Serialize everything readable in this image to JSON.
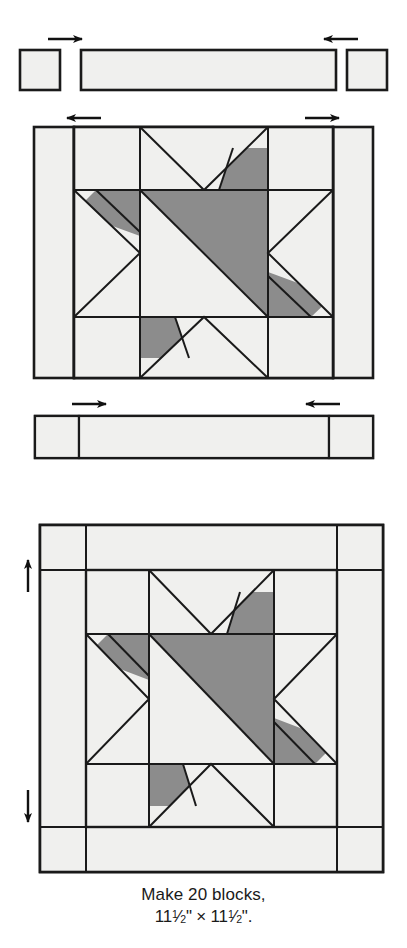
{
  "figure": {
    "caption_line_1": "Make 20 blocks,",
    "caption_line_2_prefix": "11",
    "caption_line_2_frac_num": "1",
    "caption_line_2_frac_den": "2",
    "caption_line_2_mid": "\" × 11",
    "caption_line_2_suffix": "\".",
    "caption_full": "Make 20 blocks, 11½\" × 11½\".",
    "block_count": "20",
    "finished_width": "11½\"",
    "finished_height": "11½\""
  },
  "colors": {
    "background": "#ffffff",
    "outline": "#1a1a1a",
    "light_fabric": "#f0f0ee",
    "medium_light_fabric": "#e8e8e4",
    "dark_fabric": "#8c8c8c",
    "arrow": "#111111",
    "text": "#1a1a1a"
  },
  "steps": [
    {
      "id": "top-sashing-row",
      "name": "Top sashing row pieces",
      "label": "top row: corner square, sashing strip, corner square",
      "arrows": [
        {
          "id": "top-left-arrow",
          "direction": "right",
          "name": "press-arrow-right"
        },
        {
          "id": "top-right-arrow",
          "direction": "left",
          "name": "press-arrow-left"
        }
      ],
      "pieces": [
        {
          "id": "top-left-corner-square",
          "shape": "square",
          "fabric": "light"
        },
        {
          "id": "top-sashing-strip",
          "shape": "rectangle",
          "fabric": "light"
        },
        {
          "id": "top-right-corner-square",
          "shape": "square",
          "fabric": "light"
        }
      ]
    },
    {
      "id": "center-star-unit",
      "name": "Star block with side sashing strips",
      "label": "star block center with left and right sashing strips attached",
      "arrows": [
        {
          "id": "center-left-arrow",
          "direction": "left",
          "name": "press-arrow-left"
        },
        {
          "id": "center-right-arrow",
          "direction": "right",
          "name": "press-arrow-right"
        }
      ]
    },
    {
      "id": "bottom-sashing-row",
      "name": "Bottom sashing row assembled",
      "label": "bottom row: corner square, sashing strip, corner square sewn together",
      "arrows": [
        {
          "id": "bottom-left-arrow",
          "direction": "right",
          "name": "press-arrow-right"
        },
        {
          "id": "bottom-right-arrow",
          "direction": "left",
          "name": "press-arrow-left"
        }
      ]
    },
    {
      "id": "finished-block",
      "name": "Finished block",
      "label": "completed block with sashing and corner squares on all four sides",
      "arrows": [
        {
          "id": "finished-top-arrow",
          "direction": "up",
          "name": "press-arrow-up"
        },
        {
          "id": "finished-bottom-arrow",
          "direction": "down",
          "name": "press-arrow-down"
        }
      ]
    }
  ],
  "star_block": {
    "name": "variable star / ohio-style star block",
    "grid": "3x3",
    "units": {
      "center": {
        "name": "half-square-triangle",
        "dark_corner": "upper-right"
      },
      "top_middle": {
        "name": "flying-geese-down",
        "dark_accent": "bottom-right"
      },
      "bottom_middle": {
        "name": "flying-geese-up",
        "dark_accent": "top-left"
      },
      "left_middle": {
        "name": "flying-geese-right",
        "dark_accent": "top-right"
      },
      "right_middle": {
        "name": "flying-geese-left",
        "dark_accent": "bottom-left"
      },
      "corners": {
        "name": "plain-square",
        "fabric": "light"
      }
    }
  }
}
